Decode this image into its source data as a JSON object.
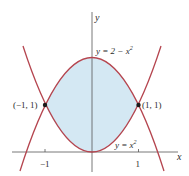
{
  "figure": {
    "type": "region-between-curves",
    "curves": [
      {
        "label": "y = 2 − x",
        "exp": "2",
        "equation": "y = 2 - x^2"
      },
      {
        "label": "y = x",
        "exp": "2",
        "equation": "y = x^2"
      }
    ],
    "points": [
      {
        "label": "(−1, 1)",
        "x": -1,
        "y": 1
      },
      {
        "label": "(1, 1)",
        "x": 1,
        "y": 1
      }
    ],
    "axes": {
      "x_label": "x",
      "y_label": "y",
      "x_ticks": [
        {
          "value": -1,
          "label": "−1"
        },
        {
          "value": 1,
          "label": "1"
        }
      ]
    },
    "colors": {
      "curve": "#b5454f",
      "fill": "#d4e8f3",
      "axis": "#555555",
      "point": "#1a1a1a"
    }
  }
}
